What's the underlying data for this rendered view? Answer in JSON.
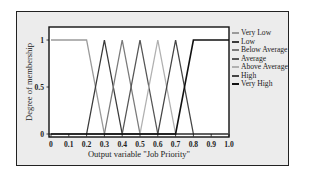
{
  "chart_data": {
    "type": "line",
    "title": "",
    "xlabel": "Output variable \"Job Priority\"",
    "ylabel": "Degree of membership",
    "xlim": [
      0,
      1.0
    ],
    "ylim": [
      0,
      1
    ],
    "x_ticks": [
      "0",
      "0.1",
      "0.2",
      "0.3",
      "0.4",
      "0.5",
      "0.6",
      "0.7",
      "0.8",
      "0.9",
      "1.0"
    ],
    "y_ticks": [
      "0",
      "0.5",
      "1"
    ],
    "grid": false,
    "legend_position": "right",
    "series": [
      {
        "name": "Very Low",
        "color": "#9a9a9a",
        "x": [
          0,
          0.2,
          0.3,
          1.0
        ],
        "y": [
          1,
          1,
          0,
          0
        ]
      },
      {
        "name": "Low",
        "color": "#3a3a3a",
        "x": [
          0.2,
          0.3,
          0.4
        ],
        "y": [
          0,
          1,
          0
        ]
      },
      {
        "name": "Below Average",
        "color": "#7a7a7a",
        "x": [
          0.3,
          0.4,
          0.5
        ],
        "y": [
          0,
          1,
          0
        ]
      },
      {
        "name": "Average",
        "color": "#555555",
        "x": [
          0.4,
          0.5,
          0.6
        ],
        "y": [
          0,
          1,
          0
        ]
      },
      {
        "name": "Above Average",
        "color": "#b0b0b0",
        "x": [
          0.5,
          0.6,
          0.7
        ],
        "y": [
          0,
          1,
          0
        ]
      },
      {
        "name": "High",
        "color": "#444444",
        "x": [
          0.6,
          0.7,
          0.8
        ],
        "y": [
          0,
          1,
          0
        ]
      },
      {
        "name": "Very High",
        "color": "#111111",
        "x": [
          0,
          0.7,
          0.8,
          1.0
        ],
        "y": [
          0,
          0,
          1,
          1
        ]
      }
    ]
  },
  "labels": {
    "xlabel": "Output variable \"Job Priority\"",
    "ylabel": "Degree of membership"
  },
  "legend": [
    {
      "label": "Very Low",
      "color": "#9a9a9a"
    },
    {
      "label": "Low",
      "color": "#3a3a3a"
    },
    {
      "label": "Below Average",
      "color": "#7a7a7a"
    },
    {
      "label": "Average",
      "color": "#555555"
    },
    {
      "label": "Above Average",
      "color": "#b0b0b0"
    },
    {
      "label": "High",
      "color": "#444444"
    },
    {
      "label": "Very High",
      "color": "#111111"
    }
  ]
}
